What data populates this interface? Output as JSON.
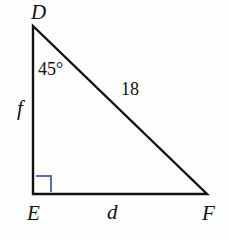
{
  "figure": {
    "type": "right-triangle",
    "name": "Triangle DEF",
    "background_color": "#fefefe",
    "stroke_color": "#111111",
    "stroke_width": 2,
    "right_angle_color": "#5b6ea8",
    "vertices": [
      {
        "name": "D",
        "label": "D",
        "x": 33,
        "y": 26
      },
      {
        "name": "E",
        "label": "E",
        "x": 33,
        "y": 194
      },
      {
        "name": "F",
        "label": "F",
        "x": 207,
        "y": 194
      }
    ],
    "sides": [
      {
        "name": "DE",
        "label": "f",
        "type": "leg",
        "from": "D",
        "to": "E"
      },
      {
        "name": "EF",
        "label": "d",
        "type": "leg",
        "from": "E",
        "to": "F"
      },
      {
        "name": "DF",
        "label": "18",
        "type": "hypotenuse",
        "from": "D",
        "to": "F"
      }
    ],
    "angles": [
      {
        "at": "D",
        "label": "45°",
        "measure": 45,
        "marked": false
      },
      {
        "at": "E",
        "label": "",
        "measure": 90,
        "marked": true,
        "marker": "right-angle-square"
      }
    ],
    "right_angle_marker": {
      "x": 36,
      "y": 176,
      "size": 15
    }
  }
}
